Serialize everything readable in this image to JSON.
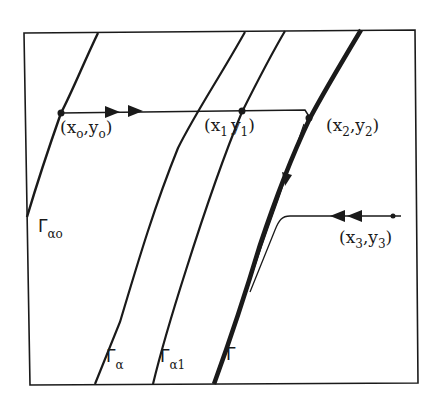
{
  "diagram": {
    "type": "phase-plane-trajectory",
    "frame": {
      "left": 24,
      "top": 33,
      "right": 415,
      "bottom": 383
    },
    "colors": {
      "ink": "#1a1a1a",
      "background": "#ffffff"
    },
    "curves": [
      {
        "id": "gamma_alpha0",
        "label": "Γ",
        "subscript": "αo",
        "weight": "medium"
      },
      {
        "id": "gamma_alpha",
        "label": "Γ",
        "subscript": "α",
        "weight": "medium"
      },
      {
        "id": "gamma_alpha1",
        "label": "Γ",
        "subscript": "α1",
        "weight": "medium"
      },
      {
        "id": "gamma",
        "label": "Γ",
        "subscript": "",
        "weight": "heavy"
      }
    ],
    "points": [
      {
        "id": "p0",
        "label_open": "(x",
        "x_sub": "o",
        "comma": ",y",
        "y_sub": "o",
        "label_close": ")"
      },
      {
        "id": "p1",
        "label_open": "(x",
        "x_sub": "1",
        "comma": "y",
        "y_sub": "1",
        "label_close": ")"
      },
      {
        "id": "p2",
        "label_open": "(x",
        "x_sub": "2",
        "comma": ",y",
        "y_sub": "2",
        "label_close": ")"
      },
      {
        "id": "p3",
        "label_open": "(x",
        "x_sub": "3",
        "comma": ",y",
        "y_sub": "3",
        "label_close": ")"
      }
    ],
    "trajectories": [
      {
        "id": "upper",
        "from": "p0",
        "to": "p2",
        "direction": "right",
        "arrows": 2
      },
      {
        "id": "lower",
        "from": "p3",
        "to": "gamma",
        "direction": "left",
        "arrows": 2
      }
    ]
  }
}
